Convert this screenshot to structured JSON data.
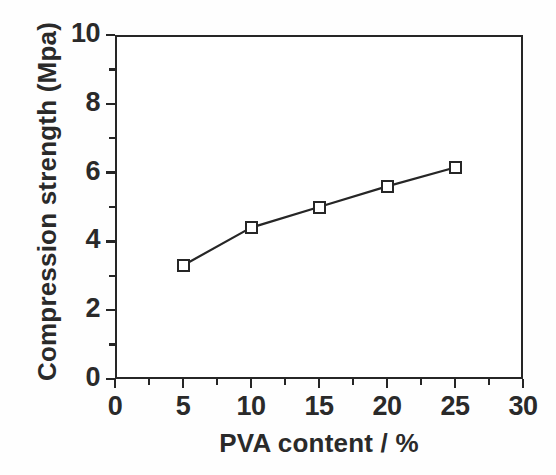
{
  "chart_data": {
    "type": "line",
    "title": "",
    "subtitle": "",
    "xlabel": "PVA content / %",
    "ylabel": "Compression strength (Mpa)",
    "xlim": [
      0,
      30
    ],
    "ylim": [
      0,
      10
    ],
    "grid": false,
    "legend": null,
    "legend_position": "none",
    "marker_style": "open-square",
    "line_style": "solid",
    "line_color": "#262626",
    "marker_face_color": "#ffffff",
    "marker_edge_color": "#262626",
    "background_color": "#ffffff",
    "x": [
      5,
      10,
      15,
      20,
      25
    ],
    "values": [
      3.3,
      4.4,
      5.0,
      5.6,
      6.15
    ],
    "points": [
      {
        "x": 5,
        "y": 3.3
      },
      {
        "x": 10,
        "y": 4.4
      },
      {
        "x": 15,
        "y": 5.0
      },
      {
        "x": 20,
        "y": 5.6
      },
      {
        "x": 25,
        "y": 6.15
      }
    ],
    "series": [
      {
        "name": "Compression strength",
        "x": [
          5,
          10,
          15,
          20,
          25
        ],
        "values": [
          3.3,
          4.4,
          5.0,
          5.6,
          6.15
        ]
      }
    ],
    "x_ticks_major": [
      0,
      5,
      10,
      15,
      20,
      25,
      30
    ],
    "x_tick_labels": [
      "0",
      "5",
      "10",
      "15",
      "20",
      "25",
      "30"
    ],
    "x_ticks_minor": [
      2.5,
      7.5,
      12.5,
      17.5,
      22.5,
      27.5
    ],
    "y_ticks_major": [
      0,
      2,
      4,
      6,
      8,
      10
    ],
    "y_tick_labels": [
      "0",
      "2",
      "4",
      "6",
      "8",
      "10"
    ],
    "y_ticks_minor": [
      1,
      3,
      5,
      7,
      9
    ],
    "tick_direction": "out",
    "annotations": []
  }
}
